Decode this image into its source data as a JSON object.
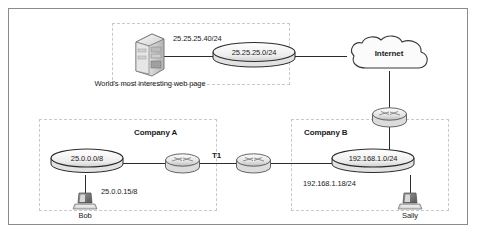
{
  "figure": {
    "background_color": "#ffffff",
    "frame_color": "#8b8b8b",
    "zone_border_color": "#c9c9c9",
    "line_color": "#2b2b2b"
  },
  "zones": [
    {
      "name": "web-server-zone",
      "label": ""
    },
    {
      "name": "company-a-zone",
      "label": "Company A"
    },
    {
      "name": "company-b-zone",
      "label": "Company B"
    }
  ],
  "labels": {
    "company_a": "Company A",
    "company_b": "Company B",
    "internet": "Internet",
    "web_server_caption": "World's most interesting web page",
    "web_server_address": "25.25.25.40/24",
    "web_segment": "25.25.25.0/24",
    "company_a_segment": "25.0.0.0/8",
    "company_b_segment": "192.168.1.0/24",
    "bob_address": "25.0.0.15/8",
    "sally_address": "192.168.1.18/24",
    "bob_name": "Bob",
    "sally_name": "Sally",
    "wan_link": "T1"
  },
  "nodes": [
    {
      "name": "web-server",
      "type": "server-tower-icon",
      "caption": "World's most interesting web page"
    },
    {
      "name": "web-network-segment",
      "type": "network-cylinder-icon",
      "label": "25.25.25.0/24"
    },
    {
      "name": "internet-cloud",
      "type": "cloud-icon",
      "label": "Internet"
    },
    {
      "name": "company-b-edge-router",
      "type": "router-icon",
      "label": ""
    },
    {
      "name": "company-a-router",
      "type": "router-icon",
      "label": ""
    },
    {
      "name": "company-b-router",
      "type": "router-icon",
      "label": ""
    },
    {
      "name": "company-a-network-segment",
      "type": "network-cylinder-icon",
      "label": "25.0.0.0/8"
    },
    {
      "name": "company-b-network-segment",
      "type": "network-cylinder-icon",
      "label": "192.168.1.0/24"
    },
    {
      "name": "bob-workstation",
      "type": "workstation-icon",
      "label": "Bob"
    },
    {
      "name": "sally-workstation",
      "type": "workstation-icon",
      "label": "Sally"
    }
  ],
  "links": [
    {
      "name": "server-to-web-segment",
      "from": "web-server",
      "to": "web-network-segment",
      "label": ""
    },
    {
      "name": "web-segment-to-internet",
      "from": "web-network-segment",
      "to": "internet-cloud",
      "label": ""
    },
    {
      "name": "internet-to-edge-router",
      "from": "internet-cloud",
      "to": "company-b-edge-router",
      "label": ""
    },
    {
      "name": "edge-router-to-company-b-segment",
      "from": "company-b-edge-router",
      "to": "company-b-network-segment",
      "label": ""
    },
    {
      "name": "company-a-router-to-company-b-router",
      "from": "company-a-router",
      "to": "company-b-router",
      "label": "T1"
    },
    {
      "name": "company-a-segment-to-router",
      "from": "company-a-network-segment",
      "to": "company-a-router",
      "label": ""
    },
    {
      "name": "company-b-router-to-segment",
      "from": "company-b-router",
      "to": "company-b-network-segment",
      "label": ""
    },
    {
      "name": "bob-to-company-a-segment",
      "from": "bob-workstation",
      "to": "company-a-network-segment",
      "label": "25.0.0.15/8"
    },
    {
      "name": "sally-to-company-b-segment",
      "from": "sally-workstation",
      "to": "company-b-network-segment",
      "label": "192.168.1.18/24"
    }
  ]
}
